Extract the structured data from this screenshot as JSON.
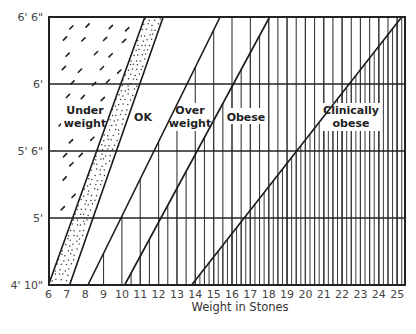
{
  "chart_data": {
    "type": "area",
    "title": "",
    "xlabel": "Weight in Stones",
    "ylabel": "",
    "x_ticks": [
      6,
      7,
      8,
      9,
      10,
      11,
      12,
      13,
      14,
      15,
      16,
      17,
      18,
      19,
      20,
      21,
      22,
      23,
      24,
      25
    ],
    "y_ticks": [
      "6' 6\"",
      "6'",
      "5' 6\"",
      "5'",
      "4' 10\""
    ],
    "xlim": [
      6,
      25.4
    ],
    "grid": "horizontal lines at each height tick",
    "legend": "none (regions labelled inline)",
    "regions": [
      {
        "name": "Under weight",
        "label_lines": [
          "Under",
          "weight"
        ],
        "pattern": "sparse diagonal dashes"
      },
      {
        "name": "OK",
        "label_lines": [
          "OK"
        ],
        "pattern": "dotted band at left edge, otherwise blank"
      },
      {
        "name": "Over weight",
        "label_lines": [
          "Over",
          "weight"
        ],
        "pattern": "vertical lines every 1 stone"
      },
      {
        "name": "Obese",
        "label_lines": [
          "Obese"
        ],
        "pattern": "vertical lines every 0.5 stone"
      },
      {
        "name": "Clinically obese",
        "label_lines": [
          "Clinically",
          "obese"
        ],
        "pattern": "dense vertical lines every 0.25 stone"
      }
    ],
    "boundaries": [
      {
        "name": "underweight/ok",
        "weight_at_4ft10": 6.0,
        "weight_at_6ft6": 11.25
      },
      {
        "name": "ok dotted band edge",
        "weight_at_4ft10": 7.15,
        "weight_at_6ft6": 12.25
      },
      {
        "name": "ok/overweight",
        "weight_at_4ft10": 8.15,
        "weight_at_6ft6": 15.35
      },
      {
        "name": "overweight/obese",
        "weight_at_4ft10": 10.15,
        "weight_at_6ft6": 18.05
      },
      {
        "name": "obese/clinically obese",
        "weight_at_4ft10": 13.8,
        "weight_at_6ft6": 25.25
      }
    ]
  },
  "axis": {
    "x_title": "Weight in Stones",
    "x_ticks": [
      "6",
      "7",
      "8",
      "9",
      "10",
      "11",
      "12",
      "13",
      "14",
      "15",
      "16",
      "17",
      "18",
      "19",
      "20",
      "21",
      "22",
      "23",
      "24",
      "25"
    ],
    "y_ticks": [
      "6' 6\"",
      "6'",
      "5' 6\"",
      "5'",
      "4' 10\""
    ]
  },
  "labels": {
    "under_1": "Under",
    "under_2": "weight",
    "ok": "OK",
    "over_1": "Over",
    "over_2": "weight",
    "obese": "Obese",
    "clin_1": "Clinically",
    "clin_2": "obese"
  },
  "colors": {
    "ink": "#222222",
    "hatch": "#3a3a3a",
    "background": "#ffffff",
    "tick_text": "#444444"
  }
}
